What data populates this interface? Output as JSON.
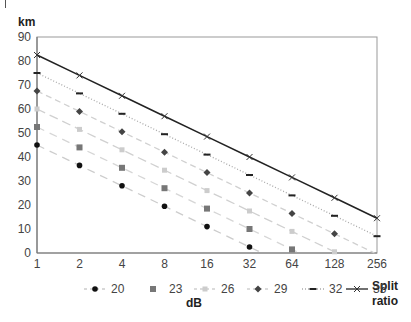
{
  "chart_data": {
    "type": "line",
    "title": "",
    "xlabel": "Split ratio",
    "ylabel": "km",
    "legend_title": "dB",
    "legend_position": "bottom",
    "grid": false,
    "x_scale": "log2",
    "categories": [
      "1",
      "2",
      "4",
      "8",
      "16",
      "32",
      "64",
      "128",
      "256"
    ],
    "x": [
      1,
      2,
      4,
      8,
      16,
      32,
      64,
      128,
      256
    ],
    "ylim": [
      0,
      90
    ],
    "yticks": [
      0,
      10,
      20,
      30,
      40,
      50,
      60,
      70,
      80,
      90
    ],
    "series": [
      {
        "name": "20",
        "marker": "circle",
        "color": "#111111",
        "dash": "8,6",
        "line_color": "#cccccc",
        "values": [
          45,
          36.5,
          28,
          19.5,
          11,
          2.5,
          null,
          null,
          null
        ]
      },
      {
        "name": "23",
        "marker": "square",
        "color": "#777777",
        "dash": "8,6",
        "line_color": "#d6d6d6",
        "values": [
          52.5,
          44,
          35.5,
          27,
          18.5,
          10,
          1.5,
          null,
          null
        ]
      },
      {
        "name": "26",
        "marker": "square-light",
        "color": "#cccccc",
        "dash": "9,5",
        "line_color": "#d0d0d0",
        "values": [
          60,
          51.5,
          43,
          34.5,
          26,
          17.5,
          9,
          0.5,
          null
        ]
      },
      {
        "name": "29",
        "marker": "diamond",
        "color": "#444444",
        "dash": "6,4",
        "line_color": "#d0d0d0",
        "values": [
          67.5,
          59,
          50.5,
          42,
          33.5,
          25,
          16.5,
          8,
          null
        ]
      },
      {
        "name": "32",
        "marker": "dash",
        "color": "#222222",
        "dash": "1,2",
        "line_color": "#aaaaaa",
        "values": [
          75,
          66.5,
          58,
          49.5,
          41,
          32.5,
          24,
          15.5,
          7
        ]
      },
      {
        "name": "35",
        "marker": "x",
        "color": "#333333",
        "dash": "",
        "line_color": "#222222",
        "values": [
          82.5,
          74,
          65.5,
          57,
          48.5,
          40,
          31.5,
          23,
          14.5
        ]
      }
    ]
  },
  "axis": {
    "y_title": "km",
    "x_title_line1": "Split",
    "x_title_line2": "ratio",
    "legend_title": "dB"
  }
}
